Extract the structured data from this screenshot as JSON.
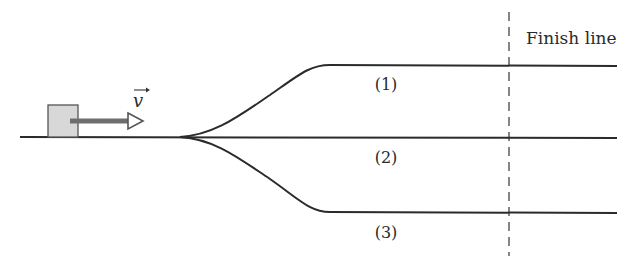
{
  "diagram": {
    "finish_label": "Finish line",
    "velocity_label": "v",
    "tracks": [
      {
        "id": 1,
        "label": "(1)"
      },
      {
        "id": 2,
        "label": "(2)"
      },
      {
        "id": 3,
        "label": "(3)"
      }
    ],
    "colors": {
      "line": "#2b2b2b",
      "block_fill": "#d8d8d8",
      "arrow": "#6e6e6e"
    }
  }
}
